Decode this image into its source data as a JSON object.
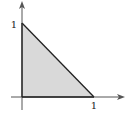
{
  "diagram": {
    "type": "shaded-region",
    "vertices": [
      [
        0,
        0
      ],
      [
        1,
        0
      ],
      [
        0,
        1
      ]
    ],
    "x_axis": {
      "tick_label": "1",
      "tick_value": 1
    },
    "y_axis": {
      "tick_label": "1",
      "tick_value": 1
    },
    "colors": {
      "fill": "#d9d9d9",
      "stroke": "#222222",
      "axis": "#555555"
    }
  }
}
